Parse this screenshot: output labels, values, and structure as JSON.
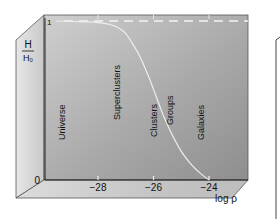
{
  "chart_data": {
    "type": "line",
    "title": "",
    "xlabel": "log ρ",
    "ylabel_numerator": "H",
    "ylabel_denominator": "H₀",
    "xlim": [
      -29.5,
      -23
    ],
    "ylim": [
      0,
      1
    ],
    "x_ticks": [
      -28,
      -26,
      -24
    ],
    "x_tick_labels": [
      "−28",
      "−26",
      "−24"
    ],
    "y_ticks": [
      0,
      1
    ],
    "y_tick_labels": [
      "0",
      "1"
    ],
    "grid": false,
    "reference_line": {
      "style": "dashed",
      "y": 1
    },
    "series": [
      {
        "name": "H/H0",
        "x": [
          -29.5,
          -28.5,
          -28,
          -27.5,
          -27.2,
          -27.0,
          -26.8,
          -26.5,
          -26.2,
          -26.0,
          -25.7,
          -25.4,
          -25.0,
          -24.6,
          -24.3,
          -24.0
        ],
        "y": [
          1.0,
          0.995,
          0.99,
          0.975,
          0.95,
          0.92,
          0.87,
          0.78,
          0.66,
          0.57,
          0.43,
          0.31,
          0.18,
          0.09,
          0.04,
          0.0
        ]
      }
    ],
    "annotations": [
      {
        "text": "Universe",
        "x": -29.3
      },
      {
        "text": "Superclusters",
        "x": -27.3
      },
      {
        "text": "Clusters",
        "x": -26.0
      },
      {
        "text": "Groups",
        "x": -25.4
      },
      {
        "text": "Galaxies",
        "x": -24.3
      }
    ]
  }
}
